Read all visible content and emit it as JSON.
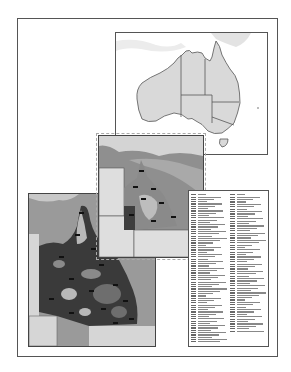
{
  "layout": {
    "description": "Map layout page with Australia overview, Queensland detail inset, large Queensland detail map and two-column legend"
  },
  "overview_map": {
    "region": "Australia",
    "states": [
      "WA",
      "NT",
      "QLD",
      "SA",
      "NSW",
      "VIC",
      "TAS"
    ],
    "colors": {
      "land": "#d9d9d9",
      "sea": "#ffffff",
      "border": "#555555",
      "neighbor_land": "#ececec"
    }
  },
  "inset_map": {
    "region": "Queensland",
    "colors": {
      "sea": "#8f8f8f",
      "land_light": "#bdbdbd",
      "land_mid": "#8a8a8a",
      "land_dark": "#3e3e3e",
      "other_states": "#dedede"
    }
  },
  "detail_map": {
    "region": "Queensland",
    "colors": {
      "sea": "#9a9a9a",
      "land_dark": "#3a3a3a",
      "land_mid": "#6e6e6e",
      "land_light": "#b8b8b8",
      "other_states": "#d6d6d6"
    }
  },
  "legend": {
    "columns": 2,
    "left_column_rows": 65,
    "right_column_rows": 58,
    "text_legible": false
  }
}
